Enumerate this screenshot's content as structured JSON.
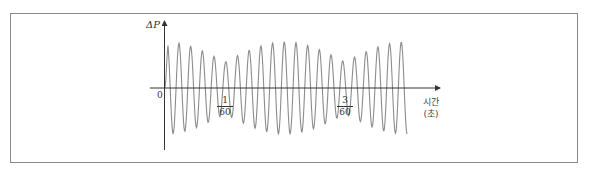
{
  "figure": {
    "y_axis_label": "ΔP",
    "x_axis_label_line1": "시간",
    "x_axis_label_line2": "(초)",
    "origin_label": "0",
    "ticks": [
      {
        "numerator": "1",
        "denominator": "60"
      },
      {
        "numerator": "3",
        "denominator": "60"
      }
    ]
  },
  "chart_data": {
    "type": "line",
    "title": "",
    "xlabel": "시간 (초)",
    "ylabel": "ΔP",
    "x_ticks": [
      "0",
      "1/60",
      "3/60"
    ],
    "beat_period_s": 0.0333,
    "envelope_min_at": [
      0.01667,
      0.05
    ],
    "envelope_max_at": [
      0,
      0.0333
    ],
    "grid": false,
    "colors": {
      "curve": "#8c8c8c",
      "axis": "#333333"
    }
  }
}
